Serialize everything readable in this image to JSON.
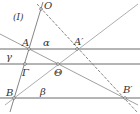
{
  "figure": {
    "label": "(I)",
    "colors": {
      "line": "#6b6b6b",
      "text": "#333333",
      "background": "#ffffff"
    }
  },
  "points": {
    "O": "O",
    "A": "A",
    "A_prime": "A′",
    "B": "B",
    "B_prime": "B′",
    "Gamma": "Γ",
    "Theta": "Θ"
  },
  "lines": {
    "alpha": "α",
    "beta": "β",
    "gamma": "γ"
  }
}
